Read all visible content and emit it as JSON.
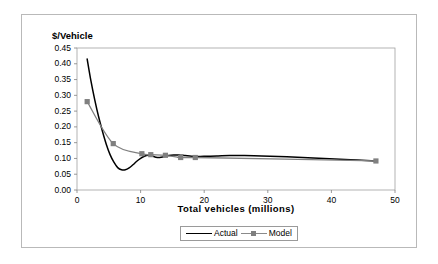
{
  "chart_data": {
    "type": "line",
    "title": "",
    "xlabel": "Total  vehicles  (millions)",
    "ylabel": "$/Vehicle",
    "xlim": [
      0,
      50
    ],
    "ylim": [
      0.0,
      0.45
    ],
    "grid": false,
    "legend_position": "bottom",
    "x_ticks": [
      "0",
      "10",
      "20",
      "30",
      "40",
      "50"
    ],
    "x_tick_values": [
      0,
      10,
      20,
      30,
      40,
      50
    ],
    "y_ticks": [
      "0.00",
      "0.05",
      "0.10",
      "0.15",
      "0.20",
      "0.25",
      "0.30",
      "0.35",
      "0.40",
      "0.45"
    ],
    "y_tick_values": [
      0.0,
      0.05,
      0.1,
      0.15,
      0.2,
      0.25,
      0.3,
      0.35,
      0.4,
      0.45
    ],
    "series": [
      {
        "name": "Actual",
        "color": "#000000",
        "marker": "none",
        "points": [
          [
            1.6,
            0.415
          ],
          [
            2.2,
            0.345
          ],
          [
            2.8,
            0.285
          ],
          [
            3.4,
            0.232
          ],
          [
            4.0,
            0.186
          ],
          [
            4.6,
            0.145
          ],
          [
            5.2,
            0.112
          ],
          [
            5.8,
            0.088
          ],
          [
            6.4,
            0.071
          ],
          [
            7.0,
            0.064
          ],
          [
            7.6,
            0.064
          ],
          [
            8.2,
            0.07
          ],
          [
            8.8,
            0.08
          ],
          [
            9.4,
            0.091
          ],
          [
            10.0,
            0.1
          ],
          [
            10.6,
            0.107
          ],
          [
            11.2,
            0.11
          ],
          [
            11.8,
            0.108
          ],
          [
            12.4,
            0.104
          ],
          [
            13.0,
            0.103
          ],
          [
            13.6,
            0.105
          ],
          [
            14.4,
            0.109
          ],
          [
            15.2,
            0.111
          ],
          [
            16.0,
            0.111
          ],
          [
            17.0,
            0.109
          ],
          [
            18.0,
            0.107
          ],
          [
            19.0,
            0.106
          ],
          [
            20.5,
            0.107
          ],
          [
            22.0,
            0.108
          ],
          [
            24.0,
            0.109
          ],
          [
            26.0,
            0.109
          ],
          [
            29.0,
            0.108
          ],
          [
            33.0,
            0.105
          ],
          [
            38.0,
            0.101
          ],
          [
            43.0,
            0.096
          ],
          [
            47.0,
            0.092
          ]
        ]
      },
      {
        "name": "Model",
        "color": "#808080",
        "marker": "square",
        "points": [
          [
            1.6,
            0.28
          ],
          [
            5.7,
            0.147
          ],
          [
            10.2,
            0.115
          ],
          [
            11.6,
            0.112
          ],
          [
            13.9,
            0.11
          ],
          [
            16.3,
            0.103
          ],
          [
            18.6,
            0.103
          ],
          [
            47.0,
            0.092
          ]
        ]
      }
    ]
  },
  "legend": {
    "entries": [
      {
        "label": "Actual",
        "color": "#000000",
        "marker": "none"
      },
      {
        "label": "Model",
        "color": "#808080",
        "marker": "square"
      }
    ]
  },
  "colors": {
    "actual": "#000000",
    "model": "#808080",
    "axis": "#808080",
    "frame": "#b9b9b9",
    "background": "#ffffff"
  }
}
